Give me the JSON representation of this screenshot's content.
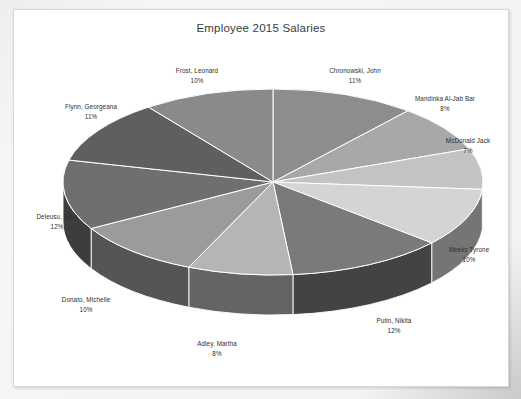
{
  "chart_data": {
    "type": "pie",
    "title": "Employee 2015 Salaries",
    "xlabel": "",
    "ylabel": "",
    "legend_position": "none",
    "grid": false,
    "style": "3d-perspective-pie",
    "categories": [
      "Chronowski, John",
      "Mandinka Al-Jab Bar",
      "McDonald Jack",
      "Meeks Tyrone",
      "Putin, Nikita",
      "Adley, Martha",
      "Donato, Michelle",
      "Deleusu, Gino",
      "Flynn, Georgeana",
      "Frost, Leonard"
    ],
    "values": [
      11,
      8,
      7,
      10,
      12,
      8,
      10,
      12,
      11,
      10
    ],
    "value_unit": "%",
    "labels": [
      {
        "name": "Chronowski, John",
        "pct": "11%",
        "value": 11,
        "color": "#8d8d8d"
      },
      {
        "name": "Mandinka Al-Jab Bar",
        "pct": "8%",
        "value": 8,
        "color": "#a8a8a8"
      },
      {
        "name": "McDonald Jack",
        "pct": "7%",
        "value": 7,
        "color": "#c3c3c3"
      },
      {
        "name": "Meeks Tyrone",
        "pct": "10%",
        "value": 10,
        "color": "#d4d4d4"
      },
      {
        "name": "Putin, Nikita",
        "pct": "12%",
        "value": 12,
        "color": "#7a7a7a"
      },
      {
        "name": "Adley, Martha",
        "pct": "8%",
        "value": 8,
        "color": "#b5b5b5"
      },
      {
        "name": "Donato, Michelle",
        "pct": "10%",
        "value": 10,
        "color": "#9b9b9b"
      },
      {
        "name": "Deleusu, Gino",
        "pct": "12%",
        "value": 12,
        "color": "#6f6f6f"
      },
      {
        "name": "Flynn, Georgeana",
        "pct": "11%",
        "value": 11,
        "color": "#5f5f5f"
      },
      {
        "name": "Frost, Leonard",
        "pct": "10%",
        "value": 10,
        "color": "#8a8a8a"
      }
    ]
  },
  "chart": {
    "title": "Employee 2015 Salaries"
  },
  "colors": {
    "page_background": "#f2f2f2",
    "canvas": "#ffffff",
    "canvas_border": "#d8d8d8",
    "title_text": "#3a3a3a",
    "label_text": "#2e2e2e",
    "slice_outline": "#ffffff"
  },
  "slice_labels": {
    "chronowski_name": "Chronowski, John",
    "chronowski_pct": "11%",
    "mandinka_name": "Mandinka Al-Jab Bar",
    "mandinka_pct": "8%",
    "mcdonald_name": "McDonald Jack",
    "mcdonald_pct": "7%",
    "meeks_name": "Meeks Tyrone",
    "meeks_pct": "10%",
    "putin_name": "Putin, Nikita",
    "putin_pct": "12%",
    "adley_name": "Adley, Martha",
    "adley_pct": "8%",
    "donato_name": "Donato, Michelle",
    "donato_pct": "10%",
    "deleusu_name": "Deleusu, Gino",
    "deleusu_pct": "12%",
    "flynn_name": "Flynn, Georgeana",
    "flynn_pct": "11%",
    "frost_name": "Frost, Leonard",
    "frost_pct": "10%"
  }
}
